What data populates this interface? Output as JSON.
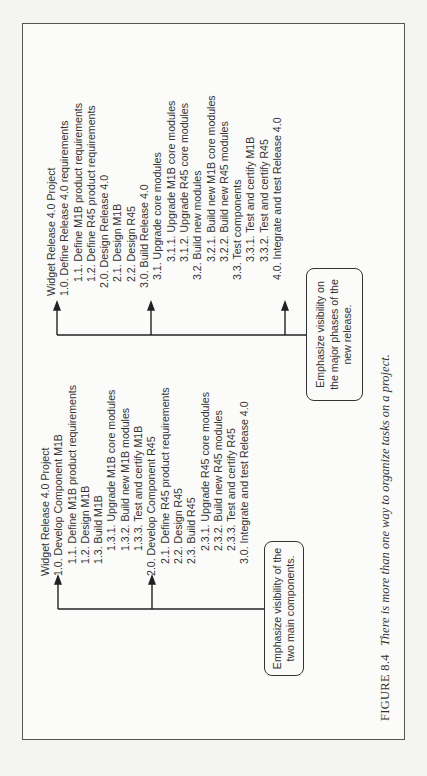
{
  "figure": {
    "number": "FIGURE 8.4",
    "caption": "There is more than one way to organize tasks on a project."
  },
  "left_tree": {
    "title": "Widget Release 4.0 Project",
    "lines": [
      {
        "text": "Widget Release 4.0 Project",
        "level": 0
      },
      {
        "text": "1.0. Develop Component M1B",
        "level": 0
      },
      {
        "text": "1.1. Define M1B product requirements",
        "level": 1
      },
      {
        "text": "1.2. Design M1B",
        "level": 1
      },
      {
        "text": "1.3. Build M1B",
        "level": 1
      },
      {
        "text": "1.3.1. Upgrade M1B core modules",
        "level": 2
      },
      {
        "text": "1.3.2. Build new M1B modules",
        "level": 2
      },
      {
        "text": "1.3.3. Test and certify M1B",
        "level": 2
      },
      {
        "text": "2.0. Develop Component R45",
        "level": 0
      },
      {
        "text": "2.1. Define R45 product requirements",
        "level": 1
      },
      {
        "text": "2.2. Design R45",
        "level": 1
      },
      {
        "text": "2.3. Build R45",
        "level": 1
      },
      {
        "text": "2.3.1. Upgrade R45 core modules",
        "level": 2
      },
      {
        "text": "2.3.2. Build new R45 modules",
        "level": 2
      },
      {
        "text": "2.3.3. Test and certify R45",
        "level": 2
      },
      {
        "text": "3.0. Integrate and test Release 4.0",
        "level": 0
      }
    ],
    "callout": "Emphasize visibility of the two main components."
  },
  "right_tree": {
    "title": "Widget Release 4.0 Project",
    "lines": [
      {
        "text": "Widget Release 4.0 Project",
        "level": 0
      },
      {
        "text": "1.0. Define Release 4.0 requirements",
        "level": 0
      },
      {
        "text": "1.1. Define M1B product requirements",
        "level": 1
      },
      {
        "text": "1.2. Define R45 product requirements",
        "level": 1
      },
      {
        "text": "2.0. Design Release 4.0",
        "level": 0
      },
      {
        "text": "2.1. Design M1B",
        "level": 1
      },
      {
        "text": "2.2. Design R45",
        "level": 1
      },
      {
        "text": "3.0. Build Release 4.0",
        "level": 0
      },
      {
        "text": "3.1. Upgrade core modules",
        "level": 1
      },
      {
        "text": "3.1.1. Upgrade M1B core modules",
        "level": 2
      },
      {
        "text": "3.1.2. Upgrade R45 core modules",
        "level": 2
      },
      {
        "text": "3.2. Build new modules",
        "level": 1
      },
      {
        "text": "3.2.1. Build new M1B core modules",
        "level": 2
      },
      {
        "text": "3.2.2. Build new R45 modules",
        "level": 2
      },
      {
        "text": "3.3. Test components",
        "level": 1
      },
      {
        "text": "3.3.1. Test and certify M1B",
        "level": 2
      },
      {
        "text": "3.3.2. Test and certify R45",
        "level": 2
      },
      {
        "text": "4.0. Integrate and test Release 4.0",
        "level": 0
      }
    ],
    "callout": "Emphasize visibility on the major phases of the new release."
  },
  "colors": {
    "line": "#222222",
    "text": "#333333",
    "border": "#555555",
    "background": "#fbfbf9"
  }
}
